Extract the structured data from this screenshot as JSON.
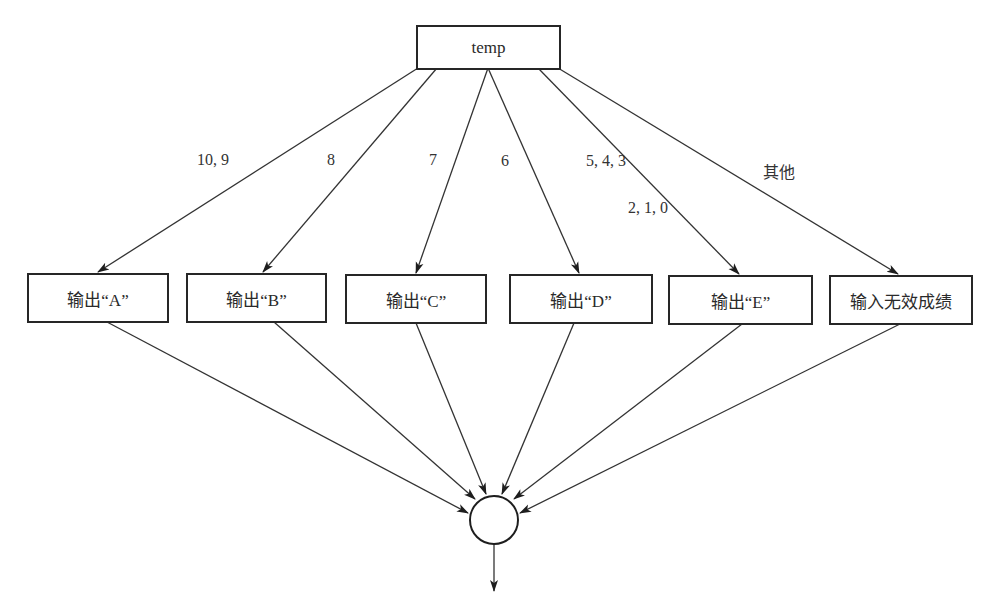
{
  "diagram": {
    "type": "flowchart-switch",
    "colors": {
      "stroke": "#262626",
      "background": "#ffffff",
      "text": "#2a2a2a"
    },
    "decision_node": {
      "label": "temp"
    },
    "branch_labels": [
      {
        "id": "a",
        "text": "10, 9"
      },
      {
        "id": "b",
        "text": "8"
      },
      {
        "id": "c",
        "text": "7"
      },
      {
        "id": "d",
        "text": "6"
      },
      {
        "id": "e1",
        "text": "5,  4,  3"
      },
      {
        "id": "e2",
        "text": "2,  1,  0"
      },
      {
        "id": "other",
        "text": "其他"
      }
    ],
    "outputs": [
      {
        "id": "a",
        "label": "输出“A”"
      },
      {
        "id": "b",
        "label": "输出“B”"
      },
      {
        "id": "c",
        "label": "输出“C”"
      },
      {
        "id": "d",
        "label": "输出“D”"
      },
      {
        "id": "e",
        "label": "输出“E”"
      },
      {
        "id": "other",
        "label": "输入无效成绩"
      }
    ],
    "merge_node": {
      "shape": "circle-connector"
    }
  }
}
